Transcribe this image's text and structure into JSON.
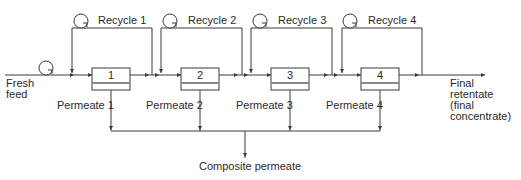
{
  "diagram": {
    "feed_label": [
      "Fresh",
      "feed"
    ],
    "modules": [
      {
        "id": "1",
        "permeate": "Permeate 1",
        "recycle": "Recycle 1"
      },
      {
        "id": "2",
        "permeate": "Permeate 2",
        "recycle": "Recycle 2"
      },
      {
        "id": "3",
        "permeate": "Permeate 3",
        "recycle": "Recycle 3"
      },
      {
        "id": "4",
        "permeate": "Permeate 4",
        "recycle": "Recycle 4"
      }
    ],
    "final_retentate_label": [
      "Final",
      "retentate",
      "(final",
      "concentrate)"
    ],
    "composite_permeate_label": "Composite permeate",
    "colors": {
      "line": "#3a3a3a",
      "separator": "#8a8a8a",
      "background": "#ffffff"
    }
  }
}
